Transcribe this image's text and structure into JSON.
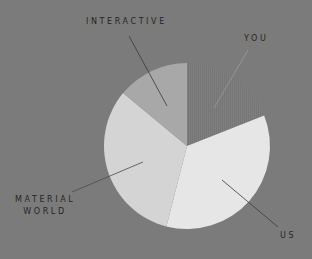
{
  "chart_data": {
    "type": "pie",
    "title": "",
    "start_angle_deg": 0,
    "direction": "clockwise",
    "labels": [
      "YOU",
      "US",
      "MATERIAL WORLD",
      "INTERACTIVE"
    ],
    "values": [
      19,
      35,
      32,
      14
    ],
    "colors": [
      "#7e7e7e",
      "#e6e6e6",
      "#d4d4d4",
      "#a8a8a8"
    ],
    "legend": "none (leader-line labels)",
    "center": [
      187,
      146
    ],
    "radius": 83
  },
  "labels": {
    "you": "YOU",
    "us": "US",
    "material_line1": "MATERIAL",
    "material_line2": "WORLD",
    "interactive": "INTERACTIVE"
  },
  "colors": {
    "background": "#7b7b7b",
    "text": "#262626",
    "leader": "#3a3a3a"
  }
}
